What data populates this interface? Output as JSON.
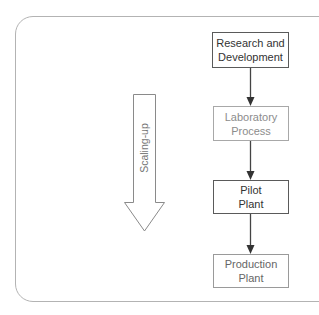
{
  "diagram": {
    "type": "flowchart",
    "scale_arrow": {
      "label": "Scaling-up",
      "direction": "down"
    },
    "steps": [
      {
        "label": "Research and\nDevelopment",
        "style": "dark"
      },
      {
        "label": "Laboratory\nProcess",
        "style": "light"
      },
      {
        "label": "Pilot\nPlant",
        "style": "dark"
      },
      {
        "label": "Production\nPlant",
        "style": "light"
      }
    ],
    "colors": {
      "frame": "#b3b3b3",
      "dark_border": "#5a5a5a",
      "light_border": "#a8a8a8",
      "dark_text": "#333333",
      "light_text": "#8c8c8c",
      "connector": "#444444"
    }
  }
}
